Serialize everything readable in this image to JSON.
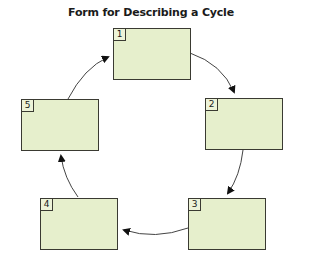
{
  "title": "Form for Describing a Cycle",
  "colors": {
    "box_fill": "#e6efcc",
    "box_border": "#3a3a32",
    "arrow": "#444444",
    "arrowhead": "#111111"
  },
  "steps": [
    {
      "number": "1",
      "text": ""
    },
    {
      "number": "2",
      "text": ""
    },
    {
      "number": "3",
      "text": ""
    },
    {
      "number": "4",
      "text": ""
    },
    {
      "number": "5",
      "text": ""
    }
  ],
  "connections": [
    {
      "from": "1",
      "to": "2"
    },
    {
      "from": "2",
      "to": "3"
    },
    {
      "from": "3",
      "to": "4"
    },
    {
      "from": "4",
      "to": "5"
    },
    {
      "from": "5",
      "to": "1"
    }
  ]
}
